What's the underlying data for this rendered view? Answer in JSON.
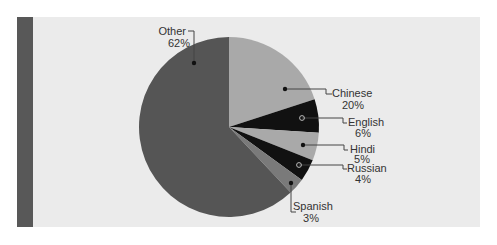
{
  "chart_data": {
    "type": "pie",
    "title": "",
    "center": [
      229,
      127
    ],
    "radius": 90,
    "start_angle_deg": 0,
    "direction": "clockwise",
    "slices": [
      {
        "label": "Chinese",
        "value": 20,
        "pct_label": "20%",
        "color": "#a9a9a9",
        "marker": "filled"
      },
      {
        "label": "English",
        "value": 6,
        "pct_label": "6%",
        "color": "#111111",
        "marker": "hollow"
      },
      {
        "label": "Hindi",
        "value": 5,
        "pct_label": "5%",
        "color": "#a9a9a9",
        "marker": "filled"
      },
      {
        "label": "Russian",
        "value": 4,
        "pct_label": "4%",
        "color": "#111111",
        "marker": "hollow"
      },
      {
        "label": "Spanish",
        "value": 3,
        "pct_label": "3%",
        "color": "#7a7a7a",
        "marker": "filled"
      },
      {
        "label": "Other",
        "value": 62,
        "pct_label": "62%",
        "color": "#555555",
        "marker": "filled"
      }
    ]
  },
  "labels": {
    "chinese": {
      "name": "Chinese",
      "pct": "20%"
    },
    "english": {
      "name": "English",
      "pct": "6%"
    },
    "hindi": {
      "name": "Hindi",
      "pct": "5%"
    },
    "russian": {
      "name": "Russian",
      "pct": "4%"
    },
    "spanish": {
      "name": "Spanish",
      "pct": "3%"
    },
    "other": {
      "name": "Other",
      "pct": "62%"
    }
  },
  "colors": {
    "panel_bg": "#ebebeb",
    "left_bar": "#585858",
    "leader_line": "#444444"
  }
}
